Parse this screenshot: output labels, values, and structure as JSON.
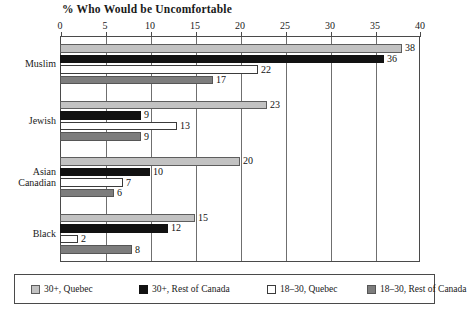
{
  "chart_data": {
    "type": "bar",
    "orientation": "horizontal",
    "title": "% Who Would be Uncomfortable",
    "xlabel": "",
    "ylabel": "",
    "xlim": [
      0,
      40
    ],
    "xticks": [
      0,
      5,
      10,
      15,
      20,
      25,
      30,
      35,
      40
    ],
    "grid": true,
    "legend_position": "bottom",
    "categories": [
      "Muslim",
      "Jewish",
      "Asian\nCanadian",
      "Black"
    ],
    "series": [
      {
        "name": "30+, Quebec",
        "color": "#c2c2c2",
        "values": [
          38,
          23,
          20,
          15
        ]
      },
      {
        "name": "30+, Rest of Canada",
        "color": "#121212",
        "values": [
          36,
          9,
          10,
          12
        ]
      },
      {
        "name": "18–30, Quebec",
        "color": "#ffffff",
        "values": [
          22,
          13,
          7,
          2
        ]
      },
      {
        "name": "18–30, Rest of Canada",
        "color": "#7d7d7d",
        "values": [
          17,
          9,
          6,
          8
        ]
      }
    ]
  }
}
